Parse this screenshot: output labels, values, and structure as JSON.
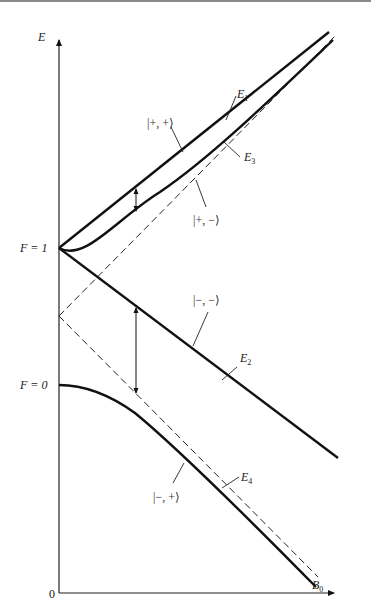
{
  "diagram": {
    "type": "energy-level-diagram",
    "axes": {
      "y_label": "E",
      "x_label": "B",
      "x_label_sub": "0",
      "origin_label": "0"
    },
    "levels": [
      {
        "label": "F = 1"
      },
      {
        "label": "F = 0"
      }
    ],
    "curves": [
      {
        "id": "E1",
        "name": "E",
        "sub": "1",
        "state": "|+, +⟩",
        "style": "solid",
        "shape": "straight-rising"
      },
      {
        "id": "E2",
        "name": "E",
        "sub": "2",
        "state": "|−, −⟩",
        "style": "solid",
        "shape": "straight-falling"
      },
      {
        "id": "E3",
        "name": "E",
        "sub": "3",
        "state": "|+, −⟩",
        "style": "solid",
        "shape": "curved-rising"
      },
      {
        "id": "E4",
        "name": "E",
        "sub": "4",
        "state": "|−, +⟩",
        "style": "solid",
        "shape": "curved-falling"
      }
    ],
    "asymptotes": [
      {
        "id": "dashed-rising",
        "style": "dashed"
      },
      {
        "id": "dashed-falling",
        "style": "dashed"
      }
    ],
    "arrows": [
      {
        "id": "gap-upper",
        "between": [
          "E1",
          "E3"
        ]
      },
      {
        "id": "gap-lower",
        "between": [
          "E2",
          "E4"
        ]
      }
    ],
    "colors": {
      "ink": "#111111",
      "background": "#ffffff"
    }
  }
}
